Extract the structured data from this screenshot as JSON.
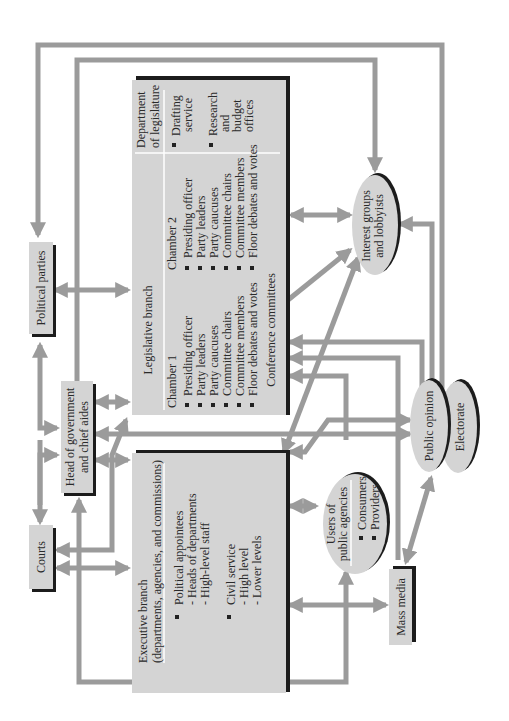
{
  "diagram": {
    "title": "",
    "orientation": "rotated-90-ccw",
    "colors": {
      "box_fill": "#d4d4d4",
      "box_shadow": "#1c1c1c",
      "arrow": "#9b9b9b",
      "text": "#2a2a2a",
      "background": "#ffffff"
    },
    "nodes": {
      "political_parties": {
        "label": "Political parties"
      },
      "courts": {
        "label": "Courts"
      },
      "head_of_government": {
        "line1": "Head of government",
        "line2": "and chief aides"
      },
      "legislative": {
        "title": "Legislative branch",
        "chamber1": {
          "title": "Chamber 1",
          "items": [
            "Presiding officer",
            "Party leaders",
            "Party caucuses",
            "Committee chairs",
            "Committee members",
            "Floor debates and votes"
          ]
        },
        "chamber2": {
          "title": "Chamber 2",
          "items": [
            "Presiding officer",
            "Party leaders",
            "Party caucuses",
            "Committee chairs",
            "Committee members",
            "Floor debates and votes"
          ]
        },
        "conference": "Conference committees",
        "department": {
          "title1": "Department",
          "title2": "of legislature",
          "item1_line1": "Drafting",
          "item1_line2": "service",
          "item2_line1": "Research",
          "item2_line2": "and",
          "item2_line3": "budget",
          "item2_line4": "offices"
        }
      },
      "executive": {
        "title1": "Executive branch",
        "title2": "(departments, agencies, and commissions)",
        "group1": {
          "title": "Political appointees",
          "sub": [
            "- Heads of departments",
            "- High-level staff"
          ]
        },
        "group2": {
          "title": "Civil service",
          "sub": [
            "- High level",
            "- Lower levels"
          ]
        }
      },
      "users": {
        "line1": "Users of",
        "line2": "public agencies",
        "items": [
          "Consumers",
          "Providers"
        ]
      },
      "interest_groups": {
        "line1": "Interest groups",
        "line2": "and lobbyists"
      },
      "public_opinion": {
        "label": "Public opinion"
      },
      "electorate": {
        "label": "Electorate"
      },
      "mass_media": {
        "label": "Mass media"
      }
    },
    "edges": [
      [
        "political_parties",
        "legislative",
        "both"
      ],
      [
        "political_parties",
        "head_of_government",
        "both"
      ],
      [
        "head_of_government",
        "legislative",
        "both"
      ],
      [
        "head_of_government",
        "executive",
        "both"
      ],
      [
        "courts",
        "executive",
        "both"
      ],
      [
        "courts",
        "head_of_government",
        "to"
      ],
      [
        "legislative",
        "courts",
        "to"
      ],
      [
        "legislative",
        "interest_groups",
        "both"
      ],
      [
        "interest_groups",
        "political_parties",
        "to"
      ],
      [
        "electorate",
        "political_parties",
        "to"
      ],
      [
        "public_opinion",
        "interest_groups",
        "to"
      ],
      [
        "public_opinion",
        "legislative",
        "to"
      ],
      [
        "public_opinion",
        "head_of_government",
        "both"
      ],
      [
        "executive",
        "users",
        "both"
      ],
      [
        "executive",
        "mass_media",
        "both"
      ],
      [
        "mass_media",
        "public_opinion",
        "both"
      ],
      [
        "users",
        "legislative",
        "to"
      ],
      [
        "executive",
        "interest_groups",
        "both"
      ],
      [
        "legislative",
        "mass_media",
        "to"
      ]
    ]
  }
}
